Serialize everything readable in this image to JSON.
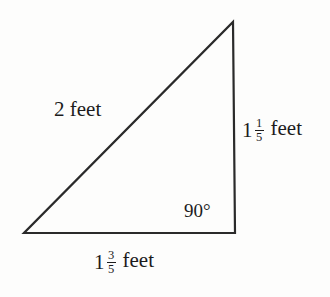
{
  "figure": {
    "background_color": "#fdfdfc",
    "stroke_color": "#2a2a2a",
    "stroke_width": 2.2,
    "width": 330,
    "height": 297
  },
  "shape": {
    "type": "right-triangle",
    "vertices": {
      "bottom_left": {
        "x": 24,
        "y": 233
      },
      "bottom_right": {
        "x": 235,
        "y": 233
      },
      "top": {
        "x": 233,
        "y": 22
      }
    }
  },
  "labels": {
    "hypotenuse": {
      "text": "2 feet",
      "value": "2",
      "unit": "feet"
    },
    "vertical_leg": {
      "whole": "1",
      "numerator": "1",
      "denominator": "5",
      "unit": "feet",
      "text": "1 1/5 feet"
    },
    "horizontal_leg": {
      "whole": "1",
      "numerator": "3",
      "denominator": "5",
      "unit": "feet",
      "text": "1 3/5 feet"
    },
    "right_angle": {
      "text": "90°",
      "value": "90",
      "unit": "degrees"
    }
  }
}
